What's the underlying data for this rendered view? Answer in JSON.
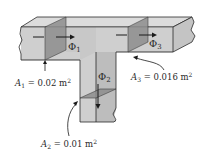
{
  "diagram": {
    "flux_labels": {
      "phi1": {
        "symbol": "Φ",
        "subscript": "1"
      },
      "phi2": {
        "symbol": "Φ",
        "subscript": "2"
      },
      "phi3": {
        "symbol": "Φ",
        "subscript": "3"
      }
    },
    "areas": {
      "a1": {
        "symbol": "A",
        "subscript": "1",
        "eq": " = 0.02 m",
        "sup": "2",
        "value": 0.02,
        "unit": "m²"
      },
      "a2": {
        "symbol": "A",
        "subscript": "2",
        "eq": " = 0.01 m",
        "sup": "2",
        "value": 0.01,
        "unit": "m²"
      },
      "a3": {
        "symbol": "A",
        "subscript": "3",
        "eq": " = 0.016 m",
        "sup": "2",
        "value": 0.016,
        "unit": "m²"
      }
    },
    "colors": {
      "body_front": "#cfcfcf",
      "body_top": "#dcdcdc",
      "body_side": "#bdbdbd",
      "section": "#8e8e8e",
      "outline": "#2a2a2a"
    }
  }
}
